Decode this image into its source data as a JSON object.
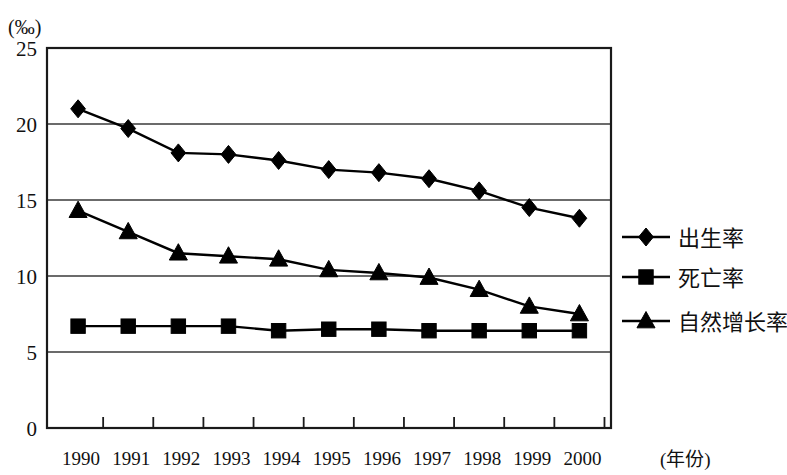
{
  "chart_data": {
    "type": "line",
    "title": "",
    "subtitle": "",
    "xlabel": "(年份)",
    "ylabel": "(‰)",
    "unit_label": "(‰)",
    "categories": [
      "1990",
      "1991",
      "1992",
      "1993",
      "1994",
      "1995",
      "1996",
      "1997",
      "1998",
      "1999",
      "2000"
    ],
    "x": [
      1990,
      1991,
      1992,
      1993,
      1994,
      1995,
      1996,
      1997,
      1998,
      1999,
      2000
    ],
    "ylim": [
      0,
      25
    ],
    "yticks": [
      "0",
      "5",
      "10",
      "15",
      "20",
      "25"
    ],
    "ytick_values": [
      0,
      5,
      10,
      15,
      20,
      25
    ],
    "grid": "horizontal",
    "legend_position": "right",
    "series": [
      {
        "name": "出生率",
        "marker": "diamond",
        "color": "#000000",
        "values": [
          21.0,
          19.7,
          18.1,
          18.0,
          17.6,
          17.0,
          16.8,
          16.4,
          15.6,
          14.5,
          13.8
        ]
      },
      {
        "name": "死亡率",
        "marker": "square",
        "color": "#000000",
        "values": [
          6.7,
          6.7,
          6.7,
          6.7,
          6.4,
          6.5,
          6.5,
          6.4,
          6.4,
          6.4,
          6.4
        ]
      },
      {
        "name": "自然增长率",
        "marker": "triangle",
        "color": "#000000",
        "values": [
          14.3,
          12.9,
          11.5,
          11.3,
          11.1,
          10.4,
          10.2,
          9.9,
          9.1,
          8.0,
          7.5
        ]
      }
    ]
  },
  "axes": {
    "y_unit": "(‰)",
    "x_title": "(年份)"
  },
  "legend": {
    "items": [
      {
        "label": "出生率",
        "marker": "diamond"
      },
      {
        "label": "死亡率",
        "marker": "square"
      },
      {
        "label": "自然增长率",
        "marker": "triangle"
      }
    ]
  }
}
